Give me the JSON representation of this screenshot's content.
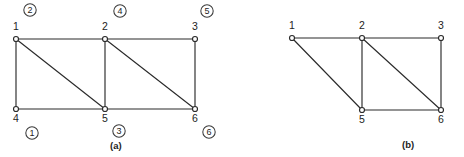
{
  "figure": {
    "background_color": "#ffffff",
    "line_color": "#2b2b2b",
    "panels": [
      {
        "id": "panel-a",
        "caption": "(a)",
        "caption_pos": {
          "x": 110,
          "y": 149
        },
        "nodes": [
          {
            "id": "n1",
            "label": "1",
            "x": 16,
            "y": 39,
            "label_x": 13,
            "label_y": 30
          },
          {
            "id": "n2",
            "label": "2",
            "x": 105,
            "y": 39,
            "label_x": 102,
            "label_y": 30
          },
          {
            "id": "n3",
            "label": "3",
            "x": 195,
            "y": 39,
            "label_x": 192,
            "label_y": 30
          },
          {
            "id": "n4",
            "label": "4",
            "x": 16,
            "y": 109,
            "label_x": 13,
            "label_y": 122
          },
          {
            "id": "n5",
            "label": "5",
            "x": 105,
            "y": 109,
            "label_x": 102,
            "label_y": 122
          },
          {
            "id": "n6",
            "label": "6",
            "x": 195,
            "y": 109,
            "label_x": 192,
            "label_y": 122
          }
        ],
        "edges": [
          {
            "from": "n1",
            "to": "n2",
            "kind": "horizontal-top-left"
          },
          {
            "from": "n2",
            "to": "n3",
            "kind": "horizontal-top-right"
          },
          {
            "from": "n1",
            "to": "n4",
            "kind": "vertical-left"
          },
          {
            "from": "n2",
            "to": "n5",
            "kind": "vertical-middle"
          },
          {
            "from": "n3",
            "to": "n6",
            "kind": "vertical-right"
          },
          {
            "from": "n4",
            "to": "n5",
            "kind": "horizontal-bottom-left"
          },
          {
            "from": "n5",
            "to": "n6",
            "kind": "horizontal-bottom-right"
          },
          {
            "from": "n1",
            "to": "n5",
            "kind": "diagonal-left"
          },
          {
            "from": "n2",
            "to": "n6",
            "kind": "diagonal-right"
          }
        ],
        "badges": [
          {
            "label": "1",
            "x": 32,
            "y": 133
          },
          {
            "label": "2",
            "x": 30,
            "y": 10
          },
          {
            "label": "3",
            "x": 119,
            "y": 131
          },
          {
            "label": "4",
            "x": 120,
            "y": 11
          },
          {
            "label": "5",
            "x": 207,
            "y": 11
          },
          {
            "label": "6",
            "x": 209,
            "y": 132
          }
        ]
      },
      {
        "id": "panel-b",
        "caption": "(b)",
        "caption_pos": {
          "x": 402,
          "y": 148
        },
        "nodes": [
          {
            "id": "m1",
            "label": "1",
            "x": 292,
            "y": 38,
            "label_x": 289,
            "label_y": 29
          },
          {
            "id": "m2",
            "label": "2",
            "x": 362,
            "y": 38,
            "label_x": 359,
            "label_y": 29
          },
          {
            "id": "m3",
            "label": "3",
            "x": 441,
            "y": 38,
            "label_x": 438,
            "label_y": 29
          },
          {
            "id": "m5",
            "label": "5",
            "x": 362,
            "y": 110,
            "label_x": 359,
            "label_y": 123
          },
          {
            "id": "m6",
            "label": "6",
            "x": 441,
            "y": 110,
            "label_x": 438,
            "label_y": 123
          }
        ],
        "edges": [
          {
            "from": "m1",
            "to": "m2",
            "kind": "horizontal-top-left"
          },
          {
            "from": "m2",
            "to": "m3",
            "kind": "horizontal-top-right"
          },
          {
            "from": "m1",
            "to": "m5",
            "kind": "diagonal-left"
          },
          {
            "from": "m2",
            "to": "m5",
            "kind": "vertical-middle"
          },
          {
            "from": "m2",
            "to": "m6",
            "kind": "diagonal-right"
          },
          {
            "from": "m5",
            "to": "m6",
            "kind": "horizontal-bottom"
          },
          {
            "from": "m3",
            "to": "m6",
            "kind": "vertical-right"
          }
        ],
        "badges": []
      }
    ]
  }
}
